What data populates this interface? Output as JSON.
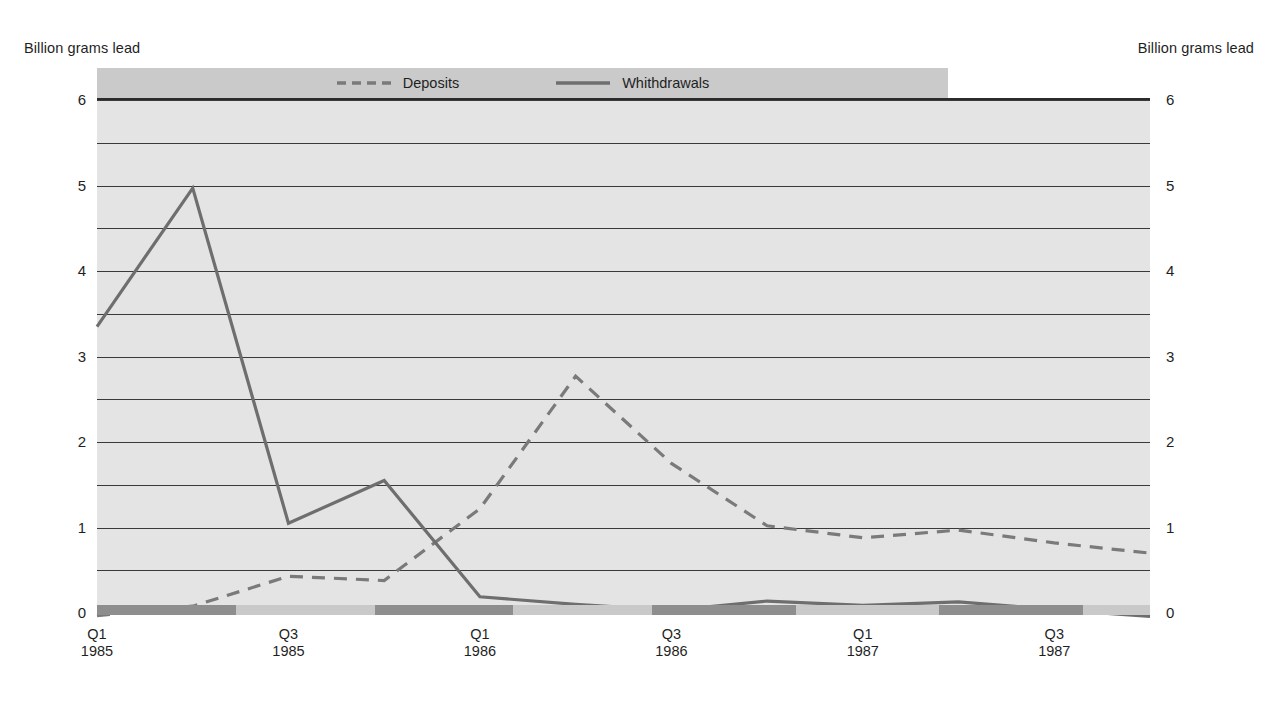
{
  "axis_titles": {
    "left": "Billion grams lead",
    "right": "Billion grams lead"
  },
  "legend": {
    "items": [
      {
        "label": "Deposits",
        "style": "dashed",
        "color": "#7a7a7a",
        "icon": "dashed-line-icon"
      },
      {
        "label": "Whithdrawals",
        "style": "solid",
        "color": "#6e6e6e",
        "icon": "solid-line-icon"
      }
    ]
  },
  "colors": {
    "plot_background": "#e4e4e4",
    "legend_background": "#cacaca",
    "gridline": "#3a3a3a",
    "frame": "#2b2b2b",
    "band_dark": "#8e8e8e",
    "band_light": "#c9c9c9",
    "deposits": "#7a7a7a",
    "withdrawals": "#6e6e6e"
  },
  "y_axis": {
    "labels": [
      "0",
      "1",
      "2",
      "3",
      "4",
      "5",
      "6"
    ],
    "min": 0,
    "max": 6,
    "tick_step": 1,
    "gridline_step": 0.5,
    "gridlines": [
      0,
      0.5,
      1,
      1.5,
      2,
      2.5,
      3,
      3.5,
      4,
      4.5,
      5,
      5.5,
      6
    ]
  },
  "x_axis": {
    "ticks": [
      {
        "quarter": "Q1",
        "year": "1985",
        "index": 0
      },
      {
        "quarter": "Q3",
        "year": "1985",
        "index": 2
      },
      {
        "quarter": "Q1",
        "year": "1986",
        "index": 4
      },
      {
        "quarter": "Q3",
        "year": "1986",
        "index": 6
      },
      {
        "quarter": "Q1",
        "year": "1987",
        "index": 8
      },
      {
        "quarter": "Q3",
        "year": "1987",
        "index": 10
      }
    ],
    "band_segments": [
      {
        "from_index": 0,
        "to_index": 1.45,
        "shade": "dark"
      },
      {
        "from_index": 1.45,
        "to_index": 2.9,
        "shade": "light"
      },
      {
        "from_index": 2.9,
        "to_index": 4.35,
        "shade": "dark"
      },
      {
        "from_index": 4.35,
        "to_index": 5.8,
        "shade": "light"
      },
      {
        "from_index": 5.8,
        "to_index": 7.3,
        "shade": "dark"
      },
      {
        "from_index": 7.3,
        "to_index": 8.8,
        "shade": "light"
      },
      {
        "from_index": 8.8,
        "to_index": 10.3,
        "shade": "dark"
      },
      {
        "from_index": 10.3,
        "to_index": 11,
        "shade": "light"
      }
    ]
  },
  "chart_data": {
    "type": "line",
    "title": "",
    "subtitle": "",
    "xlabel": "",
    "ylabel": "Billion grams lead",
    "ylim": [
      0,
      6
    ],
    "ytick_labels": [
      "0",
      "1",
      "2",
      "3",
      "4",
      "5",
      "6"
    ],
    "grid": true,
    "legend_position": "top-center",
    "x": [
      "Q1 1985",
      "Q2 1985",
      "Q3 1985",
      "Q4 1985",
      "Q1 1986",
      "Q2 1986",
      "Q3 1986",
      "Q4 1986",
      "Q1 1987",
      "Q2 1987",
      "Q3 1987",
      "Q4 1987"
    ],
    "series": [
      {
        "name": "Deposits",
        "style": "dashed",
        "color": "#7a7a7a",
        "values": [
          -0.03,
          0.08,
          0.43,
          0.38,
          1.22,
          2.77,
          1.75,
          1.02,
          0.88,
          0.97,
          0.82,
          0.7
        ]
      },
      {
        "name": "Whithdrawals",
        "style": "solid",
        "color": "#6e6e6e",
        "values": [
          3.35,
          4.97,
          1.05,
          1.55,
          0.19,
          0.1,
          0.03,
          0.14,
          0.09,
          0.13,
          0.04,
          -0.04
        ]
      }
    ]
  }
}
